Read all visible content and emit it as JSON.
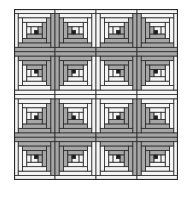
{
  "image": {
    "description": "Log cabin quilt pattern, 4x4 blocks in grayscale",
    "rows": 4,
    "cols": 4
  },
  "colors": {
    "background": "#ffffff",
    "light": "#f4f4f4",
    "dark": "#a6a6a6",
    "center": "#1a1a1a",
    "outline": "#2a2a2a"
  },
  "block": {
    "width": 41,
    "height": 42.75,
    "strip_rings": 4
  },
  "orientations": [
    [
      "tl",
      "tr",
      "tl",
      "tr"
    ],
    [
      "bl",
      "br",
      "bl",
      "br"
    ],
    [
      "tl",
      "tr",
      "tl",
      "tr"
    ],
    [
      "bl",
      "br",
      "bl",
      "br"
    ]
  ]
}
